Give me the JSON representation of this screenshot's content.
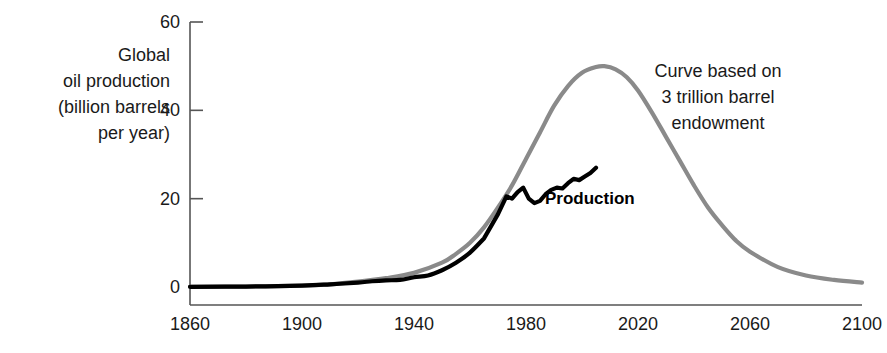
{
  "chart_data": {
    "type": "line",
    "title": "",
    "xlabel": "",
    "ylabel": "Global oil production (billion barrels per year)",
    "xlim": [
      1860,
      2100
    ],
    "ylim": [
      0,
      60
    ],
    "grid": false,
    "legend_position": "inline-annotations",
    "x_ticks": [
      1860,
      1900,
      1940,
      1980,
      2020,
      2060,
      2100
    ],
    "y_ticks": [
      0,
      20,
      40,
      60
    ],
    "series": [
      {
        "name": "Curve based on 3 trillion barrel endowment",
        "color": "#8a8a8a",
        "style": "hubbert-bell",
        "x": [
          1860,
          1880,
          1900,
          1910,
          1920,
          1930,
          1940,
          1950,
          1955,
          1960,
          1965,
          1970,
          1975,
          1980,
          1985,
          1990,
          1995,
          2000,
          2005,
          2008,
          2012,
          2016,
          2020,
          2025,
          2030,
          2035,
          2040,
          2045,
          2050,
          2055,
          2060,
          2070,
          2080,
          2090,
          2100
        ],
        "values": [
          0.05,
          0.1,
          0.3,
          0.6,
          1.2,
          2.0,
          3.2,
          5.5,
          7.5,
          10.0,
          13.5,
          18.0,
          23.0,
          29.0,
          35.0,
          41.0,
          45.5,
          48.5,
          49.8,
          50.0,
          49.3,
          47.5,
          44.5,
          39.5,
          34.0,
          28.5,
          23.0,
          18.0,
          14.0,
          10.5,
          8.0,
          4.5,
          2.6,
          1.6,
          1.0
        ]
      },
      {
        "name": "Production",
        "color": "#000000",
        "style": "historical-data",
        "x": [
          1860,
          1880,
          1900,
          1910,
          1920,
          1925,
          1930,
          1935,
          1940,
          1945,
          1950,
          1955,
          1960,
          1965,
          1970,
          1973,
          1975,
          1977,
          1979,
          1981,
          1983,
          1985,
          1987,
          1989,
          1991,
          1993,
          1995,
          1997,
          1999,
          2001,
          2003,
          2005
        ],
        "values": [
          0.05,
          0.1,
          0.3,
          0.6,
          1.0,
          1.3,
          1.5,
          1.6,
          2.2,
          2.6,
          3.8,
          5.5,
          7.8,
          11.0,
          16.5,
          20.5,
          20.0,
          21.5,
          22.5,
          20.0,
          19.0,
          19.5,
          21.0,
          22.0,
          22.5,
          22.3,
          23.5,
          24.5,
          24.2,
          25.0,
          25.8,
          27.0
        ]
      }
    ],
    "annotations": [
      {
        "id": "endowment-note",
        "lines": [
          "Curve based on",
          "3 trillion barrel",
          "endowment"
        ]
      },
      {
        "id": "production-label",
        "text": "Production"
      }
    ]
  },
  "axis": {
    "y_label_lines": [
      "Global",
      "oil production",
      "(billion barrels",
      "per year)"
    ],
    "y_tick_labels": [
      "60",
      "40",
      "20",
      "0"
    ],
    "x_tick_labels": [
      "1860",
      "1900",
      "1940",
      "1980",
      "2020",
      "2060",
      "2100"
    ]
  },
  "colors": {
    "model_curve": "#8a8a8a",
    "production_curve": "#000000",
    "axis": "#555555",
    "text": "#1a1a1a"
  }
}
